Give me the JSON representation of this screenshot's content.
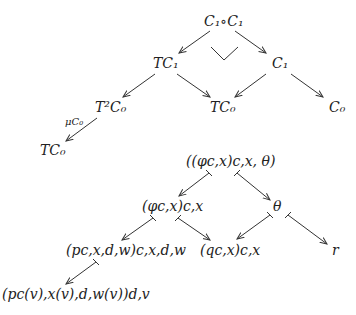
{
  "diagram_top": {
    "nodes": {
      "c1c1": "C₁∘C₁",
      "tc1": "TC₁",
      "c1": "C₁",
      "t2c0": "T²C₀",
      "tc0_mid": "TC₀",
      "c0": "C₀",
      "tc0_bottom": "TC₀"
    },
    "edge_labels": {
      "mu": "μC₀"
    },
    "pullback_mark": "corner"
  },
  "diagram_bottom": {
    "nodes": {
      "root": "((φc,x)c,x, θ)",
      "phi": "(φc,x)c,x",
      "theta": "θ",
      "p": "(pc,x,d,w)c,x,d,w",
      "q": "(qc,x)c,x",
      "r": "r",
      "pv": "(pc(v),x(v),d,w(v))d,v"
    }
  }
}
